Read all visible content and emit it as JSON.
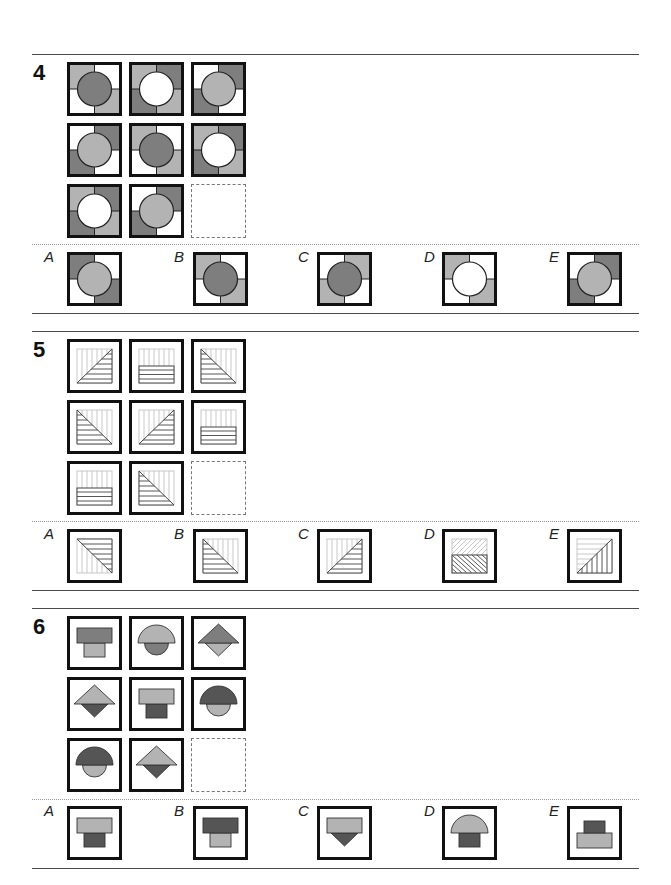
{
  "colors": {
    "dark": "#7e7e7e",
    "light": "#b3b3b3",
    "white": "#ffffff",
    "border": "#111111",
    "darkshape": "#555555"
  },
  "questions": [
    {
      "number": "4",
      "type": "quadrant-circle",
      "grid": [
        {
          "q": [
            "light",
            "white",
            "white",
            "light"
          ],
          "circle": "dark"
        },
        {
          "q": [
            "light",
            "dark",
            "dark",
            "light"
          ],
          "circle": "white"
        },
        {
          "q": [
            "white",
            "dark",
            "dark",
            "white"
          ],
          "circle": "light"
        },
        {
          "q": [
            "white",
            "dark",
            "dark",
            "white"
          ],
          "circle": "light"
        },
        {
          "q": [
            "light",
            "white",
            "white",
            "light"
          ],
          "circle": "dark"
        },
        {
          "q": [
            "light",
            "dark",
            "dark",
            "light"
          ],
          "circle": "white"
        },
        {
          "q": [
            "light",
            "dark",
            "dark",
            "light"
          ],
          "circle": "white"
        },
        {
          "q": [
            "white",
            "dark",
            "dark",
            "white"
          ],
          "circle": "light"
        },
        null
      ],
      "options": [
        {
          "label": "A",
          "q": [
            "dark",
            "white",
            "white",
            "dark"
          ],
          "circle": "light"
        },
        {
          "label": "B",
          "q": [
            "light",
            "white",
            "white",
            "light"
          ],
          "circle": "dark"
        },
        {
          "label": "C",
          "q": [
            "white",
            "light",
            "light",
            "white"
          ],
          "circle": "dark"
        },
        {
          "label": "D",
          "q": [
            "light",
            "white",
            "white",
            "light"
          ],
          "circle": "white"
        },
        {
          "label": "E",
          "q": [
            "white",
            "dark",
            "dark",
            "white"
          ],
          "circle": "light"
        }
      ]
    },
    {
      "number": "5",
      "type": "hatched",
      "grid": [
        "tri-br",
        "rect-bottom",
        "tri-bl",
        "tri-bl",
        "tri-br",
        "rect-bottom",
        "rect-bottom",
        "tri-bl",
        null
      ],
      "options": [
        {
          "label": "A",
          "kind": "tri-tr"
        },
        {
          "label": "B",
          "kind": "tri-bl"
        },
        {
          "label": "C",
          "kind": "tri-br"
        },
        {
          "label": "D",
          "kind": "diag-split"
        },
        {
          "label": "E",
          "kind": "tri-br-vert"
        }
      ]
    },
    {
      "number": "6",
      "type": "stacked-shapes",
      "grid": [
        {
          "top": "rect",
          "topColor": "dark",
          "bottom": "smallrect",
          "bottomColor": "light"
        },
        {
          "top": "semi",
          "topColor": "light",
          "bottom": "semicircle-down",
          "bottomColor": "dark"
        },
        {
          "top": "tri",
          "topColor": "dark",
          "bottom": "tri-down",
          "bottomColor": "light"
        },
        {
          "top": "tri",
          "topColor": "light",
          "bottom": "tri-down",
          "bottomColor": "darkshape"
        },
        {
          "top": "rect",
          "topColor": "light",
          "bottom": "smallrect",
          "bottomColor": "darkshape"
        },
        {
          "top": "semi",
          "topColor": "darkshape",
          "bottom": "semicircle-down",
          "bottomColor": "light"
        },
        {
          "top": "semi",
          "topColor": "darkshape",
          "bottom": "semicircle-down",
          "bottomColor": "light"
        },
        {
          "top": "tri",
          "topColor": "light",
          "bottom": "tri-down",
          "bottomColor": "darkshape"
        },
        null
      ],
      "options": [
        {
          "label": "A",
          "top": "rect",
          "topColor": "light",
          "bottom": "smallrect",
          "bottomColor": "darkshape"
        },
        {
          "label": "B",
          "top": "rect",
          "topColor": "darkshape",
          "bottom": "smallrect",
          "bottomColor": "light"
        },
        {
          "label": "C",
          "top": "rect",
          "topColor": "light",
          "bottom": "tri-down",
          "bottomColor": "darkshape"
        },
        {
          "label": "D",
          "top": "semi",
          "topColor": "light",
          "bottom": "smallrect",
          "bottomColor": "darkshape"
        },
        {
          "label": "E",
          "top": "smallrect-up",
          "topColor": "darkshape",
          "bottom": "rect",
          "bottomColor": "light"
        }
      ]
    }
  ]
}
